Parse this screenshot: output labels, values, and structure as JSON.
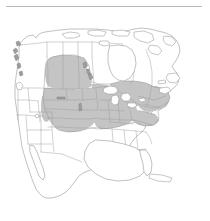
{
  "figure": {
    "kind": "distribution-map",
    "region": "North America",
    "has_top_rule": true,
    "background_color": "#ffffff",
    "caption": ""
  },
  "legend": {
    "present": false,
    "entries": [
      {
        "label": "",
        "swatch_color": "#c4c4c4",
        "meaning": "shaded range area"
      },
      {
        "label": "",
        "swatch_color": "#ffffff",
        "meaning": "outside range"
      }
    ]
  },
  "style": {
    "range_fill": "#c4c4c4",
    "land_fill": "#ffffff",
    "coastline_stroke": "#8e8e8e",
    "boundary_stroke": "#9a9a9a",
    "rule_color": "#b9b9b9",
    "lake_fill": "#ffffff"
  },
  "map": {
    "title": "",
    "projection_hint": "conic",
    "extent_label": "",
    "landmasses": [
      {
        "name": "mainland-north-america",
        "shaded": false
      },
      {
        "name": "arctic-archipelago",
        "shaded": false
      },
      {
        "name": "vancouver-island",
        "shaded": false
      },
      {
        "name": "newfoundland",
        "shaded": false
      },
      {
        "name": "baja-california",
        "shaded": false
      },
      {
        "name": "cuba",
        "shaded": false
      }
    ],
    "water_bodies": [
      {
        "name": "hudson-bay"
      },
      {
        "name": "great-lakes"
      },
      {
        "name": "gulf-of-mexico"
      },
      {
        "name": "great-salt-lake"
      },
      {
        "name": "lake-winnipeg"
      }
    ],
    "range_regions": [
      {
        "name": "alberta",
        "shaded": true
      },
      {
        "name": "saskatchewan",
        "shaded": true
      },
      {
        "name": "manitoba-south",
        "shaded": true
      },
      {
        "name": "montana-east",
        "shaded": true
      },
      {
        "name": "north-dakota",
        "shaded": true
      },
      {
        "name": "south-dakota",
        "shaded": true
      },
      {
        "name": "nebraska",
        "shaded": true
      },
      {
        "name": "kansas",
        "shaded": true
      },
      {
        "name": "oklahoma-north",
        "shaded": true
      },
      {
        "name": "minnesota",
        "shaded": true
      },
      {
        "name": "iowa",
        "shaded": true
      },
      {
        "name": "missouri",
        "shaded": true
      },
      {
        "name": "wisconsin",
        "shaded": true
      },
      {
        "name": "illinois",
        "shaded": true
      },
      {
        "name": "indiana",
        "shaded": true
      },
      {
        "name": "michigan",
        "shaded": true
      },
      {
        "name": "ohio",
        "shaded": true
      },
      {
        "name": "kentucky",
        "shaded": true
      },
      {
        "name": "ontario-south",
        "shaded": true
      },
      {
        "name": "quebec-south",
        "shaded": true
      },
      {
        "name": "pennsylvania",
        "shaded": true
      },
      {
        "name": "new-york",
        "shaded": true
      },
      {
        "name": "new-england",
        "shaded": true
      },
      {
        "name": "virginia",
        "shaded": true
      },
      {
        "name": "north-carolina-north",
        "shaded": true
      },
      {
        "name": "wyoming-east",
        "shaded": true
      },
      {
        "name": "colorado-east",
        "shaded": true
      }
    ],
    "unshaded_regions": [
      {
        "name": "alaska-panhandle",
        "shaded": false
      },
      {
        "name": "british-columbia",
        "shaded": false
      },
      {
        "name": "yukon",
        "shaded": false
      },
      {
        "name": "northwest-territories",
        "shaded": false
      },
      {
        "name": "nunavut",
        "shaded": false
      },
      {
        "name": "northern-quebec",
        "shaded": false
      },
      {
        "name": "labrador",
        "shaded": false
      },
      {
        "name": "washington",
        "shaded": false
      },
      {
        "name": "oregon",
        "shaded": false
      },
      {
        "name": "california",
        "shaded": false
      },
      {
        "name": "nevada",
        "shaded": false
      },
      {
        "name": "idaho",
        "shaded": false
      },
      {
        "name": "utah",
        "shaded": false
      },
      {
        "name": "arizona",
        "shaded": false
      },
      {
        "name": "new-mexico",
        "shaded": false
      },
      {
        "name": "texas",
        "shaded": false
      },
      {
        "name": "louisiana",
        "shaded": false
      },
      {
        "name": "florida",
        "shaded": false
      },
      {
        "name": "georgia",
        "shaded": false
      },
      {
        "name": "mexico",
        "shaded": false
      }
    ]
  }
}
